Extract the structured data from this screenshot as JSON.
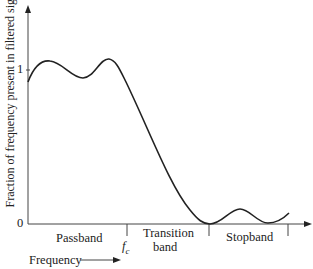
{
  "diagram": {
    "type": "filter-frequency-response",
    "y_axis_label": "Fraction of frequency present in filtered signal",
    "x_axis_label": "Frequency",
    "y_ticks": [
      {
        "label": "1",
        "value": 1
      },
      {
        "label": "0",
        "value": 0
      }
    ],
    "x_markers": [
      {
        "label": "fc",
        "label_main": "f",
        "label_sub": "c",
        "position": "passband/transition boundary"
      },
      {
        "label": "",
        "position": "transition/stopband boundary"
      },
      {
        "label": "",
        "position": "stopband end"
      }
    ],
    "bands": [
      {
        "name": "Passband"
      },
      {
        "name": "Transition band",
        "line1": "Transition",
        "line2": "band"
      },
      {
        "name": "Stopband"
      }
    ],
    "curve_description": "Ripple around 1 in passband (two peaks slightly above 1, trough below), roll-off through transition band to 0 at stopband start, small ripple near 0 in stopband",
    "colors": {
      "line": "#222222",
      "axis": "#555555"
    }
  }
}
